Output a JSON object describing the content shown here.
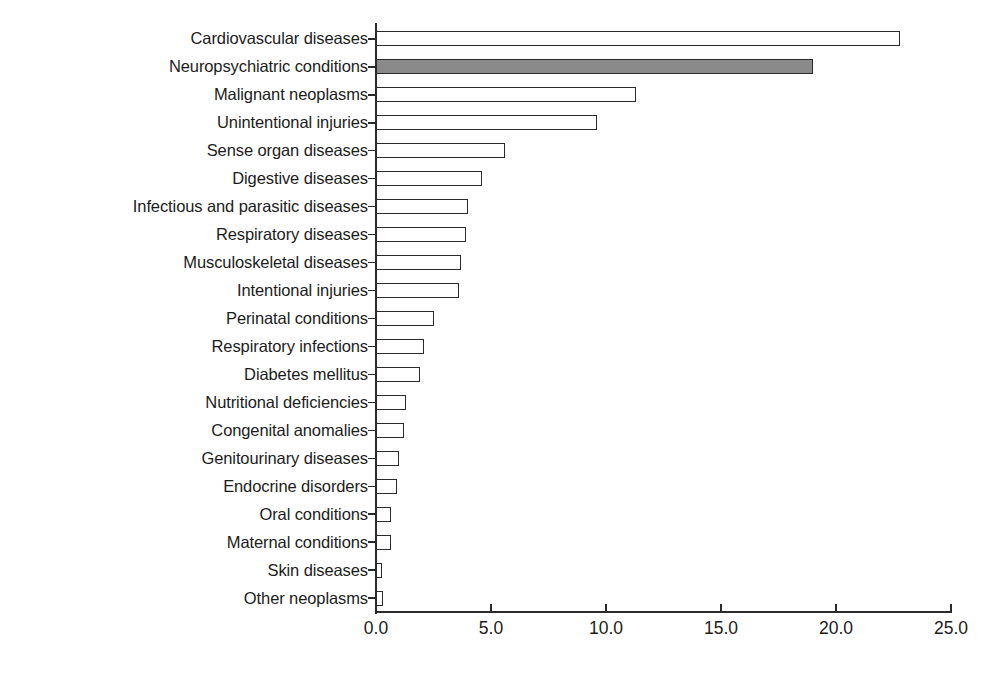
{
  "chart_data": {
    "type": "bar",
    "orientation": "horizontal",
    "title": "",
    "subtitle": "",
    "xlabel": "",
    "ylabel": "",
    "xlim": [
      0.0,
      25.0
    ],
    "xticks": [
      "0.0",
      "5.0",
      "10.0",
      "15.0",
      "20.0",
      "25.0"
    ],
    "xtick_values": [
      0.0,
      5.0,
      10.0,
      15.0,
      20.0,
      25.0
    ],
    "grid": false,
    "legend": false,
    "legend_position": "none",
    "highlight_category": "Neuropsychiatric conditions",
    "colors": {
      "bar_fill": "#ffffff",
      "bar_edge": "#2b2b2b",
      "highlight_fill": "#8a8a8a",
      "axis": "#2b2b2b",
      "text": "#1c1c1c",
      "background": "#ffffff"
    },
    "categories": [
      "Cardiovascular diseases",
      "Neuropsychiatric conditions",
      "Malignant neoplasms",
      "Unintentional injuries",
      "Sense organ diseases",
      "Digestive diseases",
      "Infectious and parasitic diseases",
      "Respiratory diseases",
      "Musculoskeletal diseases",
      "Intentional injuries",
      "Perinatal conditions",
      "Respiratory infections",
      "Diabetes mellitus",
      "Nutritional deficiencies",
      "Congenital anomalies",
      "Genitourinary diseases",
      "Endocrine disorders",
      "Oral conditions",
      "Maternal conditions",
      "Skin diseases",
      "Other neoplasms"
    ],
    "values": [
      22.8,
      19.0,
      11.3,
      9.6,
      5.6,
      4.6,
      4.0,
      3.9,
      3.7,
      3.6,
      2.5,
      2.1,
      1.9,
      1.3,
      1.2,
      1.0,
      0.9,
      0.65,
      0.65,
      0.25,
      0.3
    ]
  }
}
